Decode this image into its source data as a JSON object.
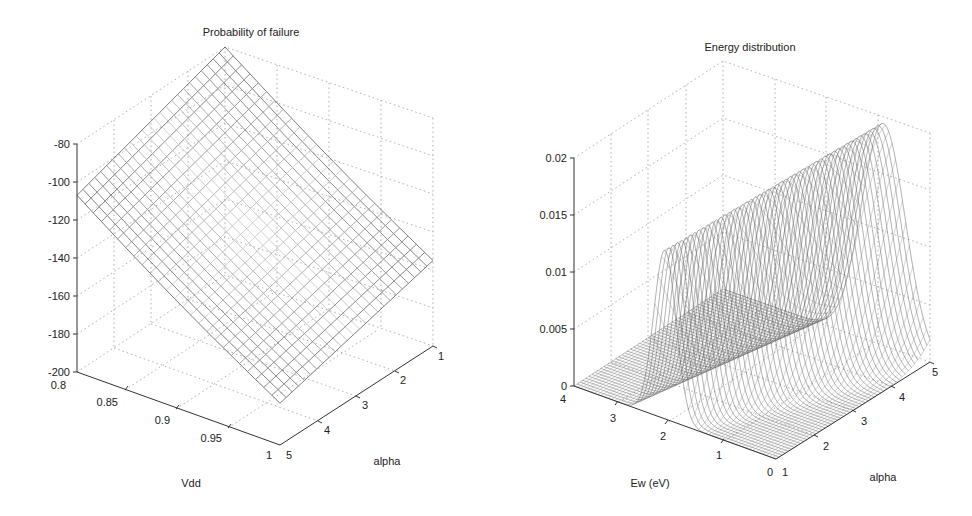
{
  "chart_data": [
    {
      "type": "surface3d",
      "title": "Probability of failure",
      "xlabel": "Vdd",
      "ylabel": "alpha",
      "zlabel": "",
      "x_ticks": [
        "0.8",
        "0.85",
        "0.9",
        "0.95",
        "1"
      ],
      "y_ticks": [
        "1",
        "2",
        "3",
        "4",
        "5"
      ],
      "z_ticks": [
        "-80",
        "-100",
        "-120",
        "-140",
        "-160",
        "-180",
        "-200"
      ],
      "xlim": [
        0.8,
        1.0
      ],
      "ylim": [
        1,
        5
      ],
      "zlim": [
        -200,
        -80
      ],
      "grid": true,
      "surface_corners": [
        {
          "Vdd": 0.8,
          "alpha": 1,
          "value": -80
        },
        {
          "Vdd": 0.8,
          "alpha": 5,
          "value": -107
        },
        {
          "Vdd": 1.0,
          "alpha": 1,
          "value": -155
        },
        {
          "Vdd": 1.0,
          "alpha": 5,
          "value": -178
        }
      ],
      "mesh": {
        "rows": 25,
        "cols": 25
      }
    },
    {
      "type": "surface3d",
      "title": "Energy distribution",
      "xlabel": "Ew (eV)",
      "ylabel": "alpha",
      "zlabel": "",
      "x_ticks": [
        "4",
        "3",
        "2",
        "1",
        "0"
      ],
      "y_ticks": [
        "1",
        "2",
        "3",
        "4",
        "5"
      ],
      "z_ticks": [
        "0.02",
        "0.015",
        "0.01",
        "0.005",
        "0"
      ],
      "xlim": [
        0,
        4
      ],
      "ylim": [
        1,
        5
      ],
      "zlim": [
        0,
        0.02
      ],
      "grid": true,
      "peaks": [
        {
          "alpha": 1,
          "Ew": 2.2,
          "value": 0.0148
        },
        {
          "alpha": 5,
          "Ew": 0.9,
          "value": 0.0195
        }
      ],
      "mesh": {
        "rows": 50,
        "cols": 50
      }
    }
  ],
  "left": {
    "title": "Probability of failure",
    "xlabel": "Vdd",
    "ylabel": "alpha",
    "z_ticks": [
      "-80",
      "-100",
      "-120",
      "-140",
      "-160",
      "-180",
      "-200"
    ],
    "x_ticks": [
      "0.8",
      "0.85",
      "0.9",
      "0.95",
      "1"
    ],
    "y_ticks": [
      "5",
      "4",
      "3",
      "2",
      "1"
    ]
  },
  "right": {
    "title": "Energy distribution",
    "xlabel": "Ew (eV)",
    "ylabel": "alpha",
    "z_ticks": [
      "0.02",
      "0.015",
      "0.01",
      "0.005",
      "0"
    ],
    "x_ticks": [
      "4",
      "3",
      "2",
      "1",
      "0"
    ],
    "y_ticks": [
      "1",
      "2",
      "3",
      "4",
      "5"
    ]
  }
}
